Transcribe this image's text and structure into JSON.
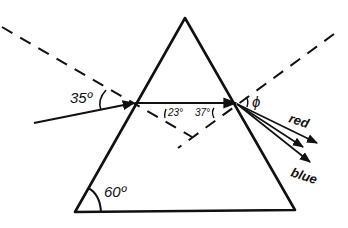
{
  "diagram": {
    "labels": {
      "incident_angle": "35º",
      "refraction_angle_1": "23°",
      "refraction_angle_2": "37°",
      "exit_angle": "ϕ",
      "apex_angle": "60º",
      "ray_red": "red",
      "ray_blue": "blue"
    },
    "colors": {
      "ink": "#111111",
      "background": "#ffffff"
    }
  }
}
